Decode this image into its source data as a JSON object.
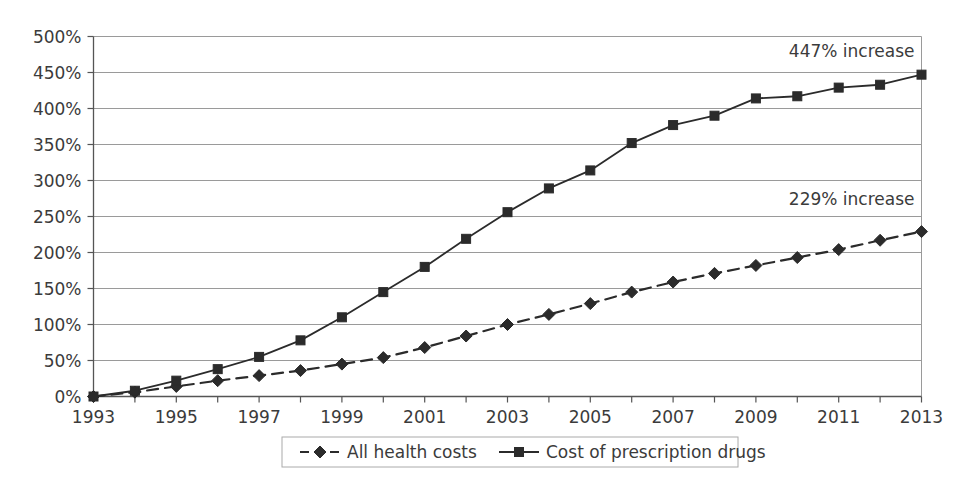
{
  "chart_data": {
    "type": "line",
    "title": "",
    "subtitle": "",
    "xlabel": "",
    "ylabel": "",
    "xlim": [
      1993,
      2013
    ],
    "ylim": [
      0,
      500
    ],
    "grid": true,
    "legend_position": "bottom",
    "y_ticks": [
      "0%",
      "50%",
      "100%",
      "150%",
      "200%",
      "250%",
      "300%",
      "350%",
      "400%",
      "450%",
      "500%"
    ],
    "y_tick_values": [
      0,
      50,
      100,
      150,
      200,
      250,
      300,
      350,
      400,
      450,
      500
    ],
    "x_ticks": [
      "1993",
      "1995",
      "1997",
      "1999",
      "2001",
      "2003",
      "2005",
      "2007",
      "2009",
      "2011",
      "2013"
    ],
    "x_tick_values": [
      1993,
      1995,
      1997,
      1999,
      2001,
      2003,
      2005,
      2007,
      2009,
      2011,
      2013
    ],
    "x": [
      1993,
      1994,
      1995,
      1996,
      1997,
      1998,
      1999,
      2000,
      2001,
      2002,
      2003,
      2004,
      2005,
      2006,
      2007,
      2008,
      2009,
      2010,
      2011,
      2012,
      2013
    ],
    "series": [
      {
        "name": "All health costs",
        "marker": "diamond",
        "line_style": "dashed",
        "color": "#2b2b2b",
        "values": [
          0,
          6,
          14,
          22,
          29,
          36,
          45,
          54,
          68,
          84,
          100,
          114,
          129,
          145,
          159,
          171,
          182,
          193,
          204,
          217,
          229
        ]
      },
      {
        "name": "Cost of prescription drugs",
        "marker": "square",
        "line_style": "solid",
        "color": "#2b2b2b",
        "values": [
          0,
          8,
          22,
          38,
          55,
          78,
          110,
          145,
          180,
          219,
          256,
          289,
          314,
          352,
          377,
          390,
          414,
          417,
          429,
          433,
          447
        ]
      }
    ],
    "annotations": [
      {
        "text": "447% increase",
        "x": 2013,
        "y": 480
      },
      {
        "text": "229% increase",
        "x": 2013,
        "y": 275
      }
    ]
  },
  "legend": {
    "items": [
      {
        "label": "All health costs",
        "marker": "diamond",
        "line_style": "dashed"
      },
      {
        "label": "Cost of prescription drugs",
        "marker": "square",
        "line_style": "solid"
      }
    ]
  },
  "colors": {
    "axis": "#555555",
    "gridline": "#9a9a9a",
    "series": "#2b2b2b",
    "text": "#3b3b3b",
    "background": "#ffffff",
    "legend_border": "#aaaaaa"
  }
}
